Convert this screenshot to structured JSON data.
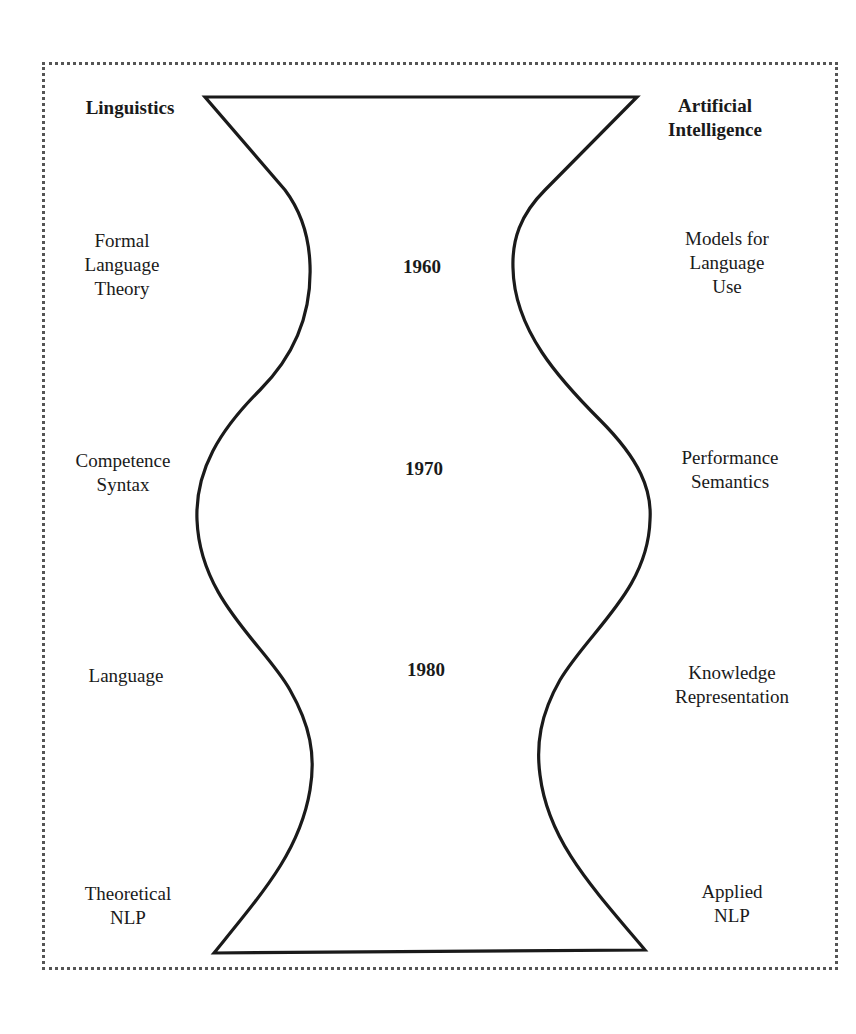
{
  "diagram": {
    "left_header": "Linguistics",
    "right_header": "Artificial\nIntelligence",
    "years": [
      "1960",
      "1970",
      "1980"
    ],
    "left_labels": [
      "Formal\nLanguage\nTheory",
      "Competence\nSyntax",
      "Language",
      "Theoretical\nNLP"
    ],
    "right_labels": [
      "Models for\nLanguage\nUse",
      "Performance\nSemantics",
      "Knowledge\nRepresentation",
      "Applied\nNLP"
    ],
    "colors": {
      "stroke": "#1a1a1a",
      "frame": "#555555",
      "background": "#ffffff"
    }
  }
}
